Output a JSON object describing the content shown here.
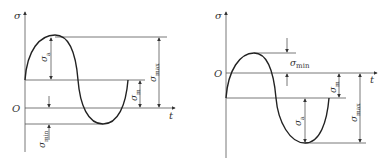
{
  "figures": [
    {
      "id": "left",
      "description": "Stress-time sine wave with positive mean stress (sigma_min negative)",
      "labels": {
        "y_axis": "σ",
        "x_axis": "t",
        "origin": "O",
        "amplitude": "σ",
        "amplitude_sub": "a",
        "mean": "σ",
        "mean_sub": "m",
        "max": "σ",
        "max_sub": "max",
        "min": "σ",
        "min_sub": "min"
      }
    },
    {
      "id": "right",
      "description": "Stress-time sine wave with negative mean stress (sigma_min positive above zero line)",
      "labels": {
        "y_axis": "σ",
        "x_axis": "t",
        "origin": "O",
        "amplitude": "σ",
        "amplitude_sub": "a",
        "mean": "σ",
        "mean_sub": "m",
        "max": "σ",
        "max_sub": "max",
        "min": "σ",
        "min_sub": "min"
      }
    }
  ],
  "colors": {
    "line": "#555555",
    "curve": "#222222",
    "text": "#333333",
    "background": "#ffffff"
  }
}
